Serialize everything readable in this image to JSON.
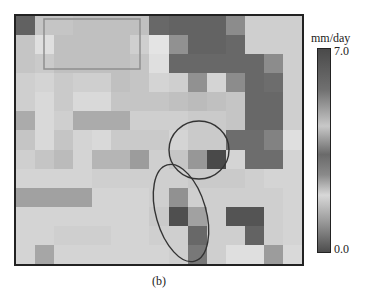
{
  "chart_data": {
    "type": "heatmap",
    "title": "",
    "caption": "(b)",
    "colorbar": {
      "unit": "mm/day",
      "max_label": "7.0",
      "min_label": "0.0",
      "range": [
        0.0,
        7.0
      ],
      "colormap": "grayscale (cyclic-like gray)"
    },
    "grid": {
      "cols": 15,
      "rows": 13
    },
    "values": [
      [
        5.5,
        1.6,
        1.6,
        1.8,
        1.8,
        1.8,
        1.8,
        5.2,
        5.4,
        5.4,
        5.4,
        3.8,
        1.2,
        1.2,
        1.2
      ],
      [
        1.6,
        0.6,
        1.8,
        1.8,
        1.8,
        1.8,
        1.2,
        0.4,
        3.6,
        5.4,
        5.4,
        5.2,
        1.2,
        1.2,
        1.2
      ],
      [
        1.6,
        1.4,
        1.8,
        1.8,
        1.8,
        1.8,
        1.6,
        0.6,
        5.2,
        5.2,
        5.2,
        5.2,
        5.2,
        3.8,
        1.2
      ],
      [
        1.2,
        1.0,
        1.4,
        1.2,
        1.2,
        1.8,
        1.6,
        1.0,
        1.2,
        3.6,
        1.0,
        3.8,
        5.2,
        5.0,
        1.2
      ],
      [
        1.2,
        0.8,
        1.4,
        0.8,
        0.8,
        1.6,
        1.6,
        1.6,
        1.8,
        2.0,
        1.8,
        1.6,
        5.2,
        5.2,
        1.2
      ],
      [
        2.6,
        0.8,
        1.2,
        2.6,
        2.6,
        2.6,
        1.2,
        1.2,
        1.2,
        1.4,
        1.4,
        1.6,
        5.2,
        5.2,
        1.2
      ],
      [
        1.6,
        0.8,
        1.6,
        1.0,
        0.8,
        1.4,
        1.4,
        1.4,
        1.0,
        1.4,
        1.4,
        5.0,
        5.0,
        4.2,
        0.6
      ],
      [
        1.2,
        1.6,
        2.0,
        1.0,
        2.2,
        2.2,
        3.2,
        1.2,
        1.6,
        3.4,
        6.4,
        1.0,
        5.0,
        5.0,
        1.0
      ],
      [
        1.0,
        1.0,
        1.0,
        1.0,
        1.2,
        1.2,
        1.2,
        1.2,
        1.2,
        1.4,
        1.4,
        1.4,
        1.2,
        1.0,
        1.0
      ],
      [
        3.0,
        3.0,
        3.0,
        3.0,
        1.0,
        1.0,
        1.0,
        1.2,
        3.6,
        1.2,
        1.2,
        1.2,
        1.2,
        1.2,
        1.0
      ],
      [
        1.0,
        1.0,
        1.0,
        1.0,
        1.0,
        1.0,
        1.0,
        1.4,
        6.2,
        3.0,
        1.2,
        6.0,
        6.0,
        1.2,
        1.0
      ],
      [
        1.0,
        1.0,
        1.2,
        1.2,
        1.2,
        1.0,
        1.0,
        1.2,
        1.2,
        5.2,
        1.2,
        1.2,
        5.4,
        1.2,
        1.0
      ],
      [
        1.0,
        2.8,
        1.0,
        1.0,
        1.0,
        1.0,
        1.0,
        1.0,
        1.2,
        4.6,
        1.2,
        0.6,
        0.6,
        3.2,
        0.8
      ]
    ],
    "annotations": [
      {
        "type": "rectangle",
        "label": "region-box",
        "position": "upper-left"
      },
      {
        "type": "ellipse",
        "label": "ellipse-upper",
        "position": "center-right"
      },
      {
        "type": "ellipse",
        "label": "ellipse-lower",
        "position": "center-bottom, tilted"
      }
    ],
    "xlabel": "",
    "ylabel": "",
    "grid_lines": false,
    "legend_position": "right"
  }
}
